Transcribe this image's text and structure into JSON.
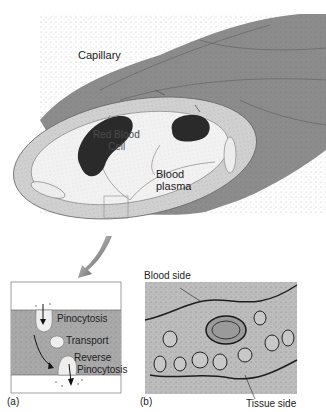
{
  "figure": {
    "top_labels": {
      "capillary": "Capillary",
      "red_blood_cell_line1": "Red Blood",
      "red_blood_cell_line2": "Cell",
      "blood_plasma_line1": "Blood",
      "blood_plasma_line2": "plasma"
    },
    "panel_a": {
      "tag": "(a)",
      "pinocytosis": "Pinocytosis",
      "transport": "Transport",
      "reverse_line1": "Reverse",
      "reverse_line2": "Pinocytosis"
    },
    "panel_b": {
      "tag": "(b)",
      "blood_side": "Blood side",
      "tissue_side": "Tissue side"
    }
  },
  "colors": {
    "tube_outer": "#8c8c8c",
    "tube_dark": "#6f6f6f",
    "wall": "#d2d2d2",
    "lumen": "#f1f1f1",
    "rbc": "#2a2a2a",
    "panel_a_mid": "#a9a9a9",
    "panel_b_bg": "#b5b5b5"
  }
}
